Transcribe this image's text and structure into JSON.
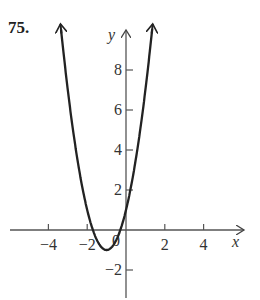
{
  "problem_number": "75.",
  "chart_data": {
    "type": "line",
    "title": "",
    "function": "y = 2x^2 + 4x + 1",
    "xlabel": "x",
    "ylabel": "y",
    "xlim": [
      -5.8,
      5.8
    ],
    "ylim": [
      -3.5,
      10.5
    ],
    "x_ticks": [
      -4,
      -2,
      2,
      4
    ],
    "x_tick_labels": [
      "−4",
      "−2",
      "2",
      "4"
    ],
    "y_ticks": [
      8,
      6,
      4,
      2,
      -2
    ],
    "y_tick_labels": [
      "8",
      "6",
      "4",
      "2",
      "−2"
    ],
    "origin_label": "0",
    "grid": false,
    "legend": null,
    "series": [
      {
        "name": "parabola",
        "x": [
          -3.5,
          -3,
          -2.5,
          -2,
          -1.5,
          -1,
          -0.5,
          0,
          0.5,
          1,
          1.35
        ],
        "y": [
          11.5,
          7,
          3.5,
          1,
          -0.5,
          -1,
          -0.5,
          1,
          3.5,
          7,
          10.05
        ]
      }
    ],
    "vertex": [
      -1,
      -1
    ],
    "y_intercept": 1,
    "color": "#222222"
  }
}
